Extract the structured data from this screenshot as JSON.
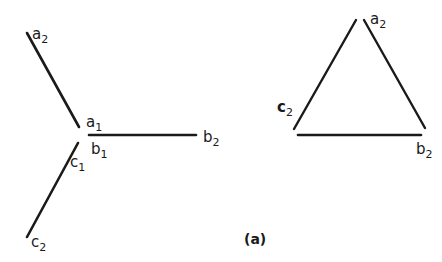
{
  "diagram": {
    "caption": "(a)",
    "line_color": "#1a1a1a",
    "star": {
      "labels": {
        "a2": {
          "base": "a",
          "sub": "2"
        },
        "a1": {
          "base": "a",
          "sub": "1"
        },
        "b1": {
          "base": "b",
          "sub": "1"
        },
        "b2": {
          "base": "b",
          "sub": "2"
        },
        "c1": {
          "base": "c",
          "sub": "1"
        },
        "c2": {
          "base": "c",
          "sub": "2"
        }
      }
    },
    "triangle": {
      "labels": {
        "a2": {
          "base": "a",
          "sub": "2"
        },
        "b2": {
          "base": "b",
          "sub": "2"
        },
        "c2": {
          "base": "c",
          "sub": "2"
        }
      }
    }
  }
}
